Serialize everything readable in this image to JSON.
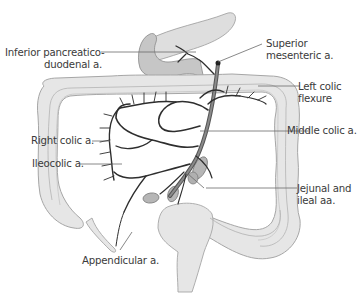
{
  "figure": {
    "title_fragment": "",
    "colors": {
      "background": "#ffffff",
      "colon_fill": "#e4e4e4",
      "colon_stroke": "#a8a8a8",
      "pancreas_fill": "#dcdcdc",
      "duodenum_fill": "#c4c4c4",
      "vessel": "#2e2e2e",
      "leader_line": "#6a6a6a",
      "label_text": "#3a3a3a",
      "cut_bowel_fill": "#b3b3b3"
    },
    "labels": {
      "inferior_pancreaticoduodenal_line1": "Inferior pancreatico-",
      "inferior_pancreaticoduodenal_line2": "duodenal a.",
      "superior_mesenteric_line1": "Superior",
      "superior_mesenteric_line2": "mesenteric a.",
      "left_colic_flexure_line1": "Left colic",
      "left_colic_flexure_line2": "flexure",
      "middle_colic": "Middle colic a.",
      "right_colic": "Right colic a.",
      "ileocolic": "Ileocolic a.",
      "jejunal_ileal_line1": "Jejunal and",
      "jejunal_ileal_line2": "ileal aa.",
      "appendicular": "Appendicular a."
    }
  }
}
